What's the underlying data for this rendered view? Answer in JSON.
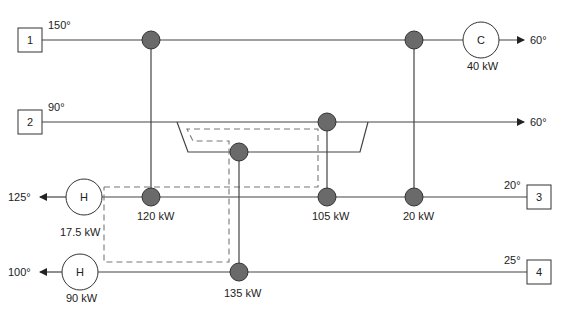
{
  "diagram": {
    "type": "heat-exchanger-network",
    "streams": [
      {
        "id": "1",
        "label": "1",
        "inlet_temp": "150°",
        "outlet_temp": "60°",
        "kind": "hot"
      },
      {
        "id": "2",
        "label": "2",
        "inlet_temp": "90°",
        "outlet_temp": "60°",
        "kind": "hot"
      },
      {
        "id": "3",
        "label": "3",
        "inlet_temp": "20°",
        "outlet_temp": "125°",
        "kind": "cold"
      },
      {
        "id": "4",
        "label": "4",
        "inlet_temp": "25°",
        "outlet_temp": "100°",
        "kind": "cold"
      }
    ],
    "utilities": [
      {
        "id": "cooler",
        "symbol": "C",
        "duty": "40 kW",
        "stream": "1"
      },
      {
        "id": "heater-3",
        "symbol": "H",
        "duty": "17.5 kW",
        "stream": "3"
      },
      {
        "id": "heater-4",
        "symbol": "H",
        "duty": "90 kW",
        "stream": "4"
      }
    ],
    "exchangers": [
      {
        "id": "E1",
        "duty": "120 kW",
        "hot": "1",
        "cold": "3"
      },
      {
        "id": "E2",
        "duty": "105 kW",
        "hot": "2",
        "cold": "3"
      },
      {
        "id": "E3",
        "duty": "20 kW",
        "hot": "1",
        "cold": "3"
      },
      {
        "id": "E4",
        "duty": "135 kW",
        "hot": "2",
        "cold": "4"
      }
    ],
    "colors": {
      "line": "#444444",
      "exchanger_fill": "#6a6a6a",
      "dashed_loop": "#777777",
      "background": "#ffffff"
    }
  }
}
